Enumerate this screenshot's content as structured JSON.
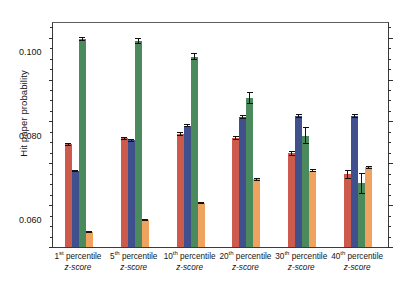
{
  "chart_data": {
    "type": "bar",
    "title": "",
    "xlabel": "",
    "ylabel": "Hit paper probability",
    "ylim": [
      0.0,
      0.107
    ],
    "yticks": [
      0.0,
      0.02,
      0.04,
      0.06,
      0.08,
      0.1
    ],
    "ytick_labels": [
      "0.000",
      "0.020",
      "0.040",
      "0.060",
      "0.080",
      "0.100"
    ],
    "minor_ticks": true,
    "grid": false,
    "legend_position": "none",
    "categories": [
      "1st percentile z-score",
      "5th percentile z-score",
      "10th percentile z-score",
      "20th percentile z-score",
      "30th percentile z-score",
      "40th percentile z-score"
    ],
    "category_labels": [
      {
        "ordinal": "1",
        "suffix": "st",
        "rest": " percentile",
        "line2": "z-score"
      },
      {
        "ordinal": "5",
        "suffix": "th",
        "rest": " percentile",
        "line2": "z-score"
      },
      {
        "ordinal": "10",
        "suffix": "th",
        "rest": " percentile",
        "line2": "z-score"
      },
      {
        "ordinal": "20",
        "suffix": "th",
        "rest": " percentile",
        "line2": "z-score"
      },
      {
        "ordinal": "30",
        "suffix": "th",
        "rest": " percentile",
        "line2": "z-score"
      },
      {
        "ordinal": "40",
        "suffix": "th",
        "rest": " percentile",
        "line2": "z-score"
      }
    ],
    "series": [
      {
        "name": "series-1",
        "color": "#cc5b4e",
        "values": [
          0.049,
          0.0519,
          0.054,
          0.0519,
          0.0449,
          0.0347
        ],
        "errors": [
          0.0008,
          0.0008,
          0.0009,
          0.0009,
          0.0012,
          0.0022
        ]
      },
      {
        "name": "series-2",
        "color": "#40508c",
        "values": [
          0.0362,
          0.0509,
          0.058,
          0.0621,
          0.0627,
          0.0627
        ],
        "errors": [
          0.0006,
          0.0007,
          0.0008,
          0.0008,
          0.001,
          0.001
        ]
      },
      {
        "name": "series-3",
        "color": "#4a8a5c",
        "values": [
          0.0995,
          0.0985,
          0.091,
          0.0712,
          0.0532,
          0.0305
        ],
        "errors": [
          0.001,
          0.0015,
          0.0018,
          0.003,
          0.004,
          0.005
        ]
      },
      {
        "name": "series-4",
        "color": "#efa35e",
        "values": [
          0.007,
          0.0128,
          0.021,
          0.0323,
          0.0365,
          0.0382
        ],
        "errors": [
          0.0005,
          0.0005,
          0.0006,
          0.0006,
          0.0007,
          0.0007
        ]
      }
    ]
  },
  "caption": ""
}
